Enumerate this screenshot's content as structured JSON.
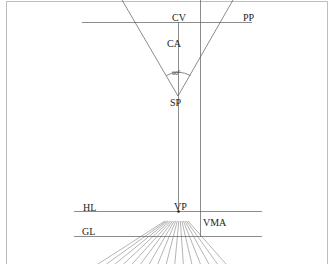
{
  "diagram": {
    "labels": {
      "cv": "CV",
      "pp": "PP",
      "ca": "CA",
      "angle": "60°",
      "sp": "SP",
      "hl": "HL",
      "vp": "VP",
      "vma": "VMA",
      "gl": "GL"
    },
    "colors": {
      "line": "#555555",
      "border": "#bbbbbb",
      "text": "#222222"
    },
    "fan_line_count": 16
  }
}
